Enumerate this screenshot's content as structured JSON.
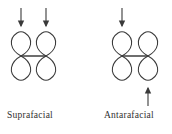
{
  "diagram": {
    "type": "orbital-interaction-diagram",
    "background_color": "#ffffff",
    "stroke_color": "#3a3a3a",
    "text_color": "#2f2f2f",
    "groups": [
      {
        "id": "suprafacial",
        "caption": "Suprafacial",
        "description": "Two p-orbitals joined by a sigma bond with two arrows approaching from the same face (both from above)",
        "orbitals": [
          {
            "cx": 21,
            "cy": 56,
            "lobe_width": 13,
            "lobe_height": 25
          },
          {
            "cx": 46,
            "cy": 56,
            "lobe_width": 13,
            "lobe_height": 25
          }
        ],
        "bond": {
          "x1": 21,
          "y1": 56,
          "x2": 46,
          "y2": 56
        },
        "arrows": [
          {
            "id": "arrow-left-down",
            "direction": "down",
            "x": 21,
            "y_start": 8,
            "y_end": 27
          },
          {
            "id": "arrow-right-down",
            "direction": "down",
            "x": 46,
            "y_start": 8,
            "y_end": 27
          }
        ]
      },
      {
        "id": "antarafacial",
        "caption": "Antarafacial",
        "description": "Two p-orbitals joined by a sigma bond with arrows approaching from opposite faces (one from above, one from below)",
        "orbitals": [
          {
            "cx": 122,
            "cy": 56,
            "lobe_width": 13,
            "lobe_height": 25
          },
          {
            "cx": 148,
            "cy": 56,
            "lobe_width": 13,
            "lobe_height": 25
          }
        ],
        "bond": {
          "x1": 122,
          "y1": 56,
          "x2": 148,
          "y2": 56
        },
        "arrows": [
          {
            "id": "arrow-top-down",
            "direction": "down",
            "x": 122,
            "y_start": 8,
            "y_end": 27
          },
          {
            "id": "arrow-bottom-up",
            "direction": "up",
            "x": 148,
            "y_start": 106,
            "y_end": 86
          }
        ]
      }
    ]
  },
  "captions": {
    "suprafacial": "Suprafacial",
    "antarafacial": "Antarafacial"
  }
}
